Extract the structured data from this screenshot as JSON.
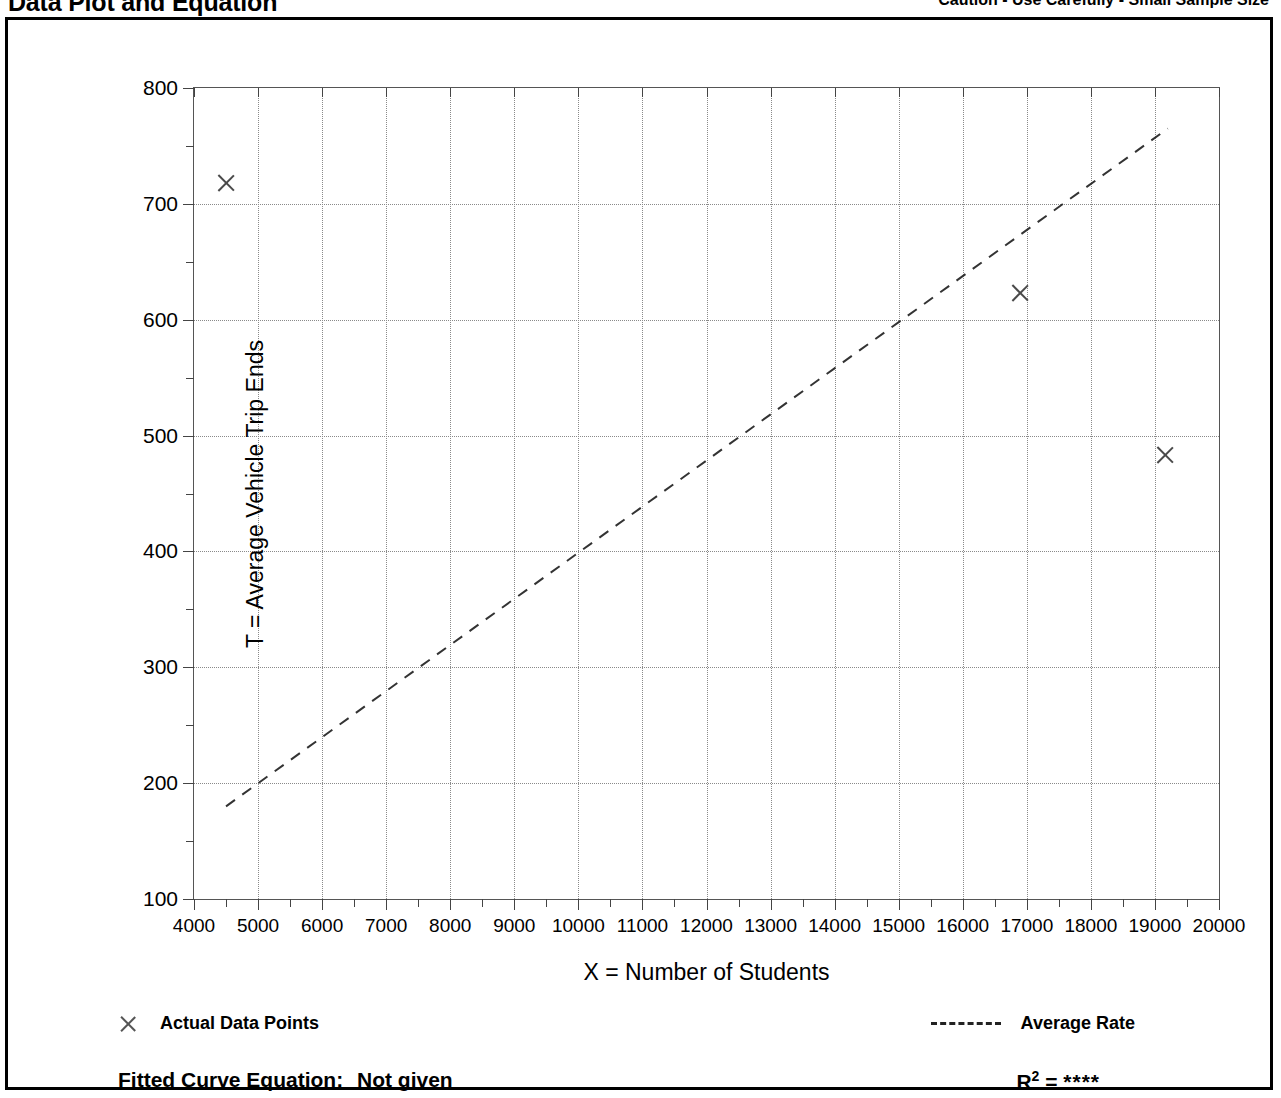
{
  "header": {
    "title": "Data Plot and Equation",
    "caution": "Caution - Use Carefully - Small Sample Size"
  },
  "legend": {
    "data_points_label": "Actual Data Points",
    "data_points_icon": "x-marker-icon",
    "average_rate_label": "Average Rate",
    "average_rate_icon": "dashed-line-icon"
  },
  "footer": {
    "equation_label": "Fitted Curve Equation:",
    "equation_value": "Not given",
    "r2_label": "R",
    "r2_exponent": "2",
    "r2_equals": "=",
    "r2_value": "****"
  },
  "chart_data": {
    "type": "scatter",
    "title": "Data Plot and Equation",
    "subtitle": "Caution - Use Carefully - Small Sample Size",
    "xlabel": "X = Number of Students",
    "ylabel": "T = Average Vehicle Trip Ends",
    "xlim": [
      4000,
      20000
    ],
    "ylim": [
      100,
      800
    ],
    "xticks": [
      4000,
      5000,
      6000,
      7000,
      8000,
      9000,
      10000,
      11000,
      12000,
      13000,
      14000,
      15000,
      16000,
      17000,
      18000,
      19000,
      20000
    ],
    "xtick_labels": [
      "4000",
      "5000",
      "6000",
      "7000",
      "8000",
      "9000",
      "10000",
      "11000",
      "12000",
      "13000",
      "14000",
      "15000",
      "16000",
      "17000",
      "18000",
      "19000",
      "20000"
    ],
    "yticks": [
      100,
      200,
      300,
      400,
      500,
      600,
      700,
      800
    ],
    "ytick_labels": [
      "100",
      "200",
      "300",
      "400",
      "500",
      "600",
      "700",
      "800"
    ],
    "x_minor_step": 500,
    "y_minor_step": 50,
    "grid": true,
    "grid_style": "dotted",
    "legend_position": "below-plot",
    "series": [
      {
        "name": "Actual Data Points",
        "type": "scatter",
        "marker": "x",
        "color": "#4a4a4a",
        "points": [
          {
            "x": 4500,
            "y": 718
          },
          {
            "x": 16900,
            "y": 623
          },
          {
            "x": 19150,
            "y": 483
          }
        ]
      },
      {
        "name": "Average Rate",
        "type": "line",
        "style": "dashed",
        "color": "#333333",
        "endpoints": [
          {
            "x": 4500,
            "y": 180
          },
          {
            "x": 19200,
            "y": 765
          }
        ],
        "slope": 0.0398,
        "intercept": 1.0
      }
    ]
  }
}
